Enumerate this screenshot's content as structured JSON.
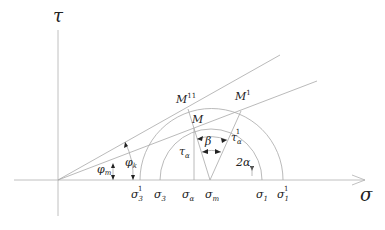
{
  "diagram": {
    "type": "mohr-circle",
    "axes": {
      "x_label": "σ",
      "y_label": "τ"
    },
    "points": {
      "M": "M",
      "M11": "M",
      "M11_sup": "11",
      "M1": "M",
      "M1_sup": "1"
    },
    "angles": {
      "phi_m": "φ",
      "phi_m_sub": "m",
      "phi_k": "φ",
      "phi_k_sub": "k",
      "beta": "β",
      "two_alpha": "2α"
    },
    "shear": {
      "tau_alpha": "τ",
      "tau_alpha_sub": "α",
      "tau_alpha1": "τ",
      "tau_alpha1_sub": "α",
      "tau_alpha1_sup": "1"
    },
    "x_ticks": [
      {
        "base": "σ",
        "sub": "3",
        "sup": "1"
      },
      {
        "base": "σ",
        "sub": "3",
        "sup": ""
      },
      {
        "base": "σ",
        "sub": "α",
        "sup": ""
      },
      {
        "base": "σ",
        "sub": "m",
        "sup": ""
      },
      {
        "base": "σ",
        "sub": "1",
        "sup": ""
      },
      {
        "base": "σ",
        "sub": "1",
        "sup": "1"
      }
    ]
  }
}
